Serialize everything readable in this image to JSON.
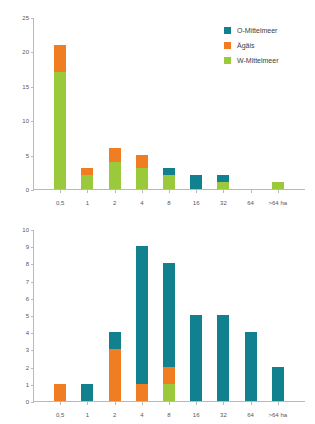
{
  "colors": {
    "o_mittelmeer": "#11818f",
    "aegais": "#f07d22",
    "w_mittelmeer": "#9aca3c",
    "axis": "#b9b9b9",
    "text": "#58585a"
  },
  "legend": {
    "items": [
      {
        "label": "O-Mittelmeer",
        "color": "#11818f",
        "key": "o_mittelmeer"
      },
      {
        "label": "Ägäis",
        "color": "#f07d22",
        "key": "aegais"
      },
      {
        "label": "W-Mittelmeer",
        "color": "#9aca3c",
        "key": "w_mittelmeer"
      }
    ]
  },
  "chart_data": [
    {
      "id": "top",
      "type": "bar",
      "stacked": true,
      "title": "",
      "xlabel": "",
      "ylabel": "",
      "categories": [
        "<0,5",
        "0,5–1",
        "1–2",
        "2–4",
        "4–8",
        "8–16",
        "16–32",
        "32–64",
        ">64"
      ],
      "xticklabels": [
        "0,5",
        "1",
        "2",
        "4",
        "8",
        "16",
        "32",
        "64",
        ">64 ha"
      ],
      "ylim": [
        0,
        25
      ],
      "yticklabels": [
        "0",
        "5",
        "10",
        "15",
        "20",
        "25"
      ],
      "ytickvalues": [
        0,
        5,
        10,
        15,
        20,
        25
      ],
      "grid": false,
      "legend_position": "top-right",
      "series": [
        {
          "name": "W-Mittelmeer",
          "color": "#9aca3c",
          "values": [
            17,
            2,
            4,
            3,
            2,
            0,
            1,
            0,
            1
          ]
        },
        {
          "name": "Ägäis",
          "color": "#f07d22",
          "values": [
            4,
            1,
            2,
            2,
            0,
            0,
            0,
            0,
            0
          ]
        },
        {
          "name": "O-Mittelmeer",
          "color": "#11818f",
          "values": [
            0,
            0,
            0,
            0,
            1,
            2,
            1,
            0,
            0
          ]
        }
      ],
      "totals": [
        21,
        3,
        6,
        5,
        3,
        2,
        2,
        0,
        1
      ]
    },
    {
      "id": "bottom",
      "type": "bar",
      "stacked": true,
      "title": "",
      "xlabel": "",
      "ylabel": "",
      "categories": [
        "<0,5",
        "0,5–1",
        "1–2",
        "2–4",
        "4–8",
        "8–16",
        "16–32",
        "32–64",
        ">64"
      ],
      "xticklabels": [
        "0,5",
        "1",
        "2",
        "4",
        "8",
        "16",
        "32",
        "64",
        ">64 ha"
      ],
      "ylim": [
        0,
        10
      ],
      "yticklabels": [
        "0",
        "1",
        "2",
        "3",
        "4",
        "5",
        "6",
        "7",
        "8",
        "9",
        "10"
      ],
      "ytickvalues": [
        0,
        1,
        2,
        3,
        4,
        5,
        6,
        7,
        8,
        9,
        10
      ],
      "grid": false,
      "legend_position": "none",
      "series": [
        {
          "name": "W-Mittelmeer",
          "color": "#9aca3c",
          "values": [
            0,
            0,
            0,
            0,
            1,
            0,
            0,
            0,
            0
          ]
        },
        {
          "name": "Ägäis",
          "color": "#f07d22",
          "values": [
            1,
            0,
            3,
            1,
            1,
            0,
            0,
            0,
            0
          ]
        },
        {
          "name": "O-Mittelmeer",
          "color": "#11818f",
          "values": [
            0,
            1,
            1,
            8,
            6,
            5,
            5,
            4,
            2
          ]
        }
      ],
      "totals": [
        1,
        1,
        4,
        9,
        8,
        5,
        5,
        4,
        2
      ]
    }
  ]
}
